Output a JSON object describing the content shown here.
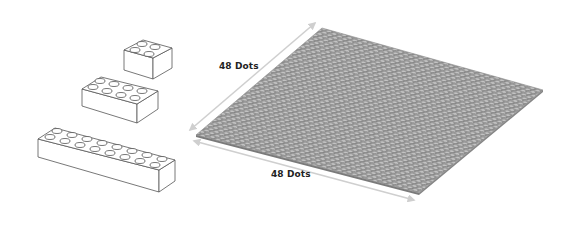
{
  "diagram": {
    "title": "",
    "colors": {
      "background": "#ffffff",
      "brick_outline": "#555555",
      "brick_fill": "#ffffff",
      "plate_fill": "#9a9a9a",
      "plate_stud": "#c4c4c4",
      "plate_stud_shadow": "#6e6e6e",
      "arrow": "#cfcfcf",
      "label": "#222222"
    },
    "bricks": [
      {
        "name": "2x2 brick",
        "studs_x": 2,
        "studs_y": 2
      },
      {
        "name": "2x4 brick",
        "studs_x": 4,
        "studs_y": 2
      },
      {
        "name": "2x8 brick",
        "studs_x": 8,
        "studs_y": 2
      }
    ],
    "baseplate": {
      "name": "48x48 baseplate",
      "studs_x": 48,
      "studs_y": 48
    },
    "dimensions": {
      "depth_label": "48 Dots",
      "width_label": "48 Dots"
    }
  }
}
